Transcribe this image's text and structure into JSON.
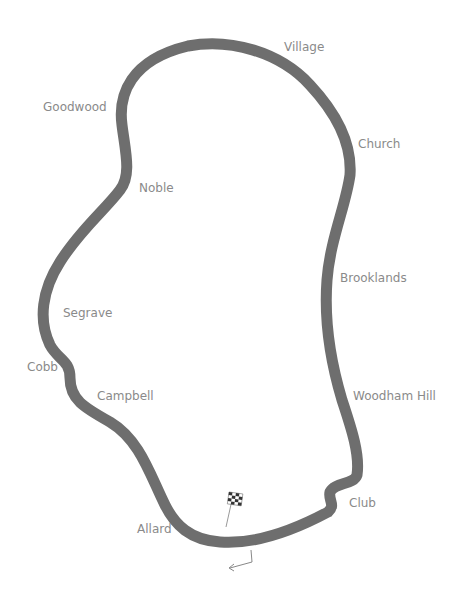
{
  "map": {
    "track_color": "#6e6e6e",
    "label_color": "#8a8a8a",
    "corners": [
      {
        "name": "Village",
        "x": 284,
        "y": 41
      },
      {
        "name": "Goodwood",
        "x": 43,
        "y": 101
      },
      {
        "name": "Church",
        "x": 358,
        "y": 138
      },
      {
        "name": "Noble",
        "x": 139,
        "y": 182
      },
      {
        "name": "Brooklands",
        "x": 340,
        "y": 272
      },
      {
        "name": "Segrave",
        "x": 63,
        "y": 307
      },
      {
        "name": "Cobb",
        "x": 27,
        "y": 361
      },
      {
        "name": "Campbell",
        "x": 97,
        "y": 390
      },
      {
        "name": "Woodham Hill",
        "x": 353,
        "y": 390
      },
      {
        "name": "Club",
        "x": 349,
        "y": 497
      },
      {
        "name": "Allard",
        "x": 137,
        "y": 523
      }
    ],
    "start_finish": {
      "icon": "checkered-flag-icon"
    },
    "direction": {
      "icon": "direction-arrow-icon"
    }
  }
}
